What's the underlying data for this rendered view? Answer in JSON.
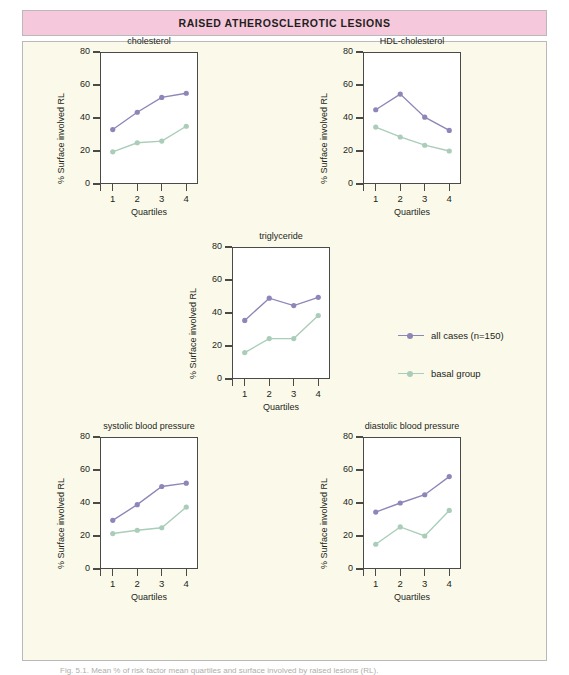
{
  "banner": {
    "title": "RAISED ATHEROSCLEROTIC LESIONS"
  },
  "caption": {
    "text": "Fig. 5.1. Mean % of risk factor mean quartiles and surface involved by raised lesions (RL)."
  },
  "legend": {
    "position": "middle-right",
    "entries": [
      {
        "label": "all cases (n=150)",
        "color": "#8d86b8"
      },
      {
        "label": "basal group",
        "color": "#a9cdb9"
      }
    ]
  },
  "axes": {
    "ylabel": "% Surface involved RL",
    "xlabel": "Quartiles",
    "yticks": [
      "0",
      "20",
      "40",
      "60",
      "80"
    ],
    "xticks": [
      "1",
      "2",
      "3",
      "4"
    ],
    "ylim": [
      0,
      80
    ],
    "grid": false
  },
  "colors": {
    "all_cases": "#8d86b8",
    "basal_group": "#a9cdb9",
    "axis": "#4a4a48",
    "panel_bg": "#fbfaea",
    "plot_bg": "#ffffff",
    "banner_bg": "#f6c8dc",
    "text": "#231f20"
  },
  "chart_data": [
    {
      "type": "line",
      "title": "cholesterol",
      "xlabel": "Quartiles",
      "ylabel": "% Surface involved RL",
      "categories": [
        "1",
        "2",
        "3",
        "4"
      ],
      "ylim": [
        0,
        80
      ],
      "yticks": [
        0,
        20,
        40,
        60,
        80
      ],
      "grid": false,
      "series": [
        {
          "name": "all cases (n=150)",
          "values": [
            33,
            43.5,
            52.5,
            55
          ]
        },
        {
          "name": "basal group",
          "values": [
            19.5,
            25,
            26,
            35
          ]
        }
      ]
    },
    {
      "type": "line",
      "title": "HDL-cholesterol",
      "xlabel": "Quartiles",
      "ylabel": "% Surface involved RL",
      "categories": [
        "1",
        "2",
        "3",
        "4"
      ],
      "ylim": [
        0,
        80
      ],
      "yticks": [
        0,
        20,
        40,
        60,
        80
      ],
      "grid": false,
      "series": [
        {
          "name": "all cases (n=150)",
          "values": [
            45,
            54.5,
            40.5,
            32.5
          ]
        },
        {
          "name": "basal group",
          "values": [
            34.5,
            28.5,
            23.5,
            20
          ]
        }
      ]
    },
    {
      "type": "line",
      "title": "triglyceride",
      "xlabel": "Quartiles",
      "ylabel": "% Surface involved RL",
      "categories": [
        "1",
        "2",
        "3",
        "4"
      ],
      "ylim": [
        0,
        80
      ],
      "yticks": [
        0,
        20,
        40,
        60,
        80
      ],
      "grid": false,
      "series": [
        {
          "name": "all cases (n=150)",
          "values": [
            35.5,
            49,
            44.5,
            49.5
          ]
        },
        {
          "name": "basal group",
          "values": [
            16,
            24.5,
            24.5,
            38.5
          ]
        }
      ]
    },
    {
      "type": "line",
      "title": "systolic blood pressure",
      "xlabel": "Quartiles",
      "ylabel": "% Surface involved RL",
      "categories": [
        "1",
        "2",
        "3",
        "4"
      ],
      "ylim": [
        0,
        80
      ],
      "yticks": [
        0,
        20,
        40,
        60,
        80
      ],
      "grid": false,
      "series": [
        {
          "name": "all cases (n=150)",
          "values": [
            29.5,
            39,
            50,
            52
          ]
        },
        {
          "name": "basal group",
          "values": [
            21.5,
            23.5,
            25,
            37.5
          ]
        }
      ]
    },
    {
      "type": "line",
      "title": "diastolic blood pressure",
      "xlabel": "Quartiles",
      "ylabel": "% Surface involved RL",
      "categories": [
        "1",
        "2",
        "3",
        "4"
      ],
      "ylim": [
        0,
        80
      ],
      "yticks": [
        0,
        20,
        40,
        60,
        80
      ],
      "grid": false,
      "series": [
        {
          "name": "all cases (n=150)",
          "values": [
            34.5,
            40,
            45,
            56
          ]
        },
        {
          "name": "basal group",
          "values": [
            15,
            25.5,
            20,
            35.5
          ]
        }
      ]
    }
  ]
}
